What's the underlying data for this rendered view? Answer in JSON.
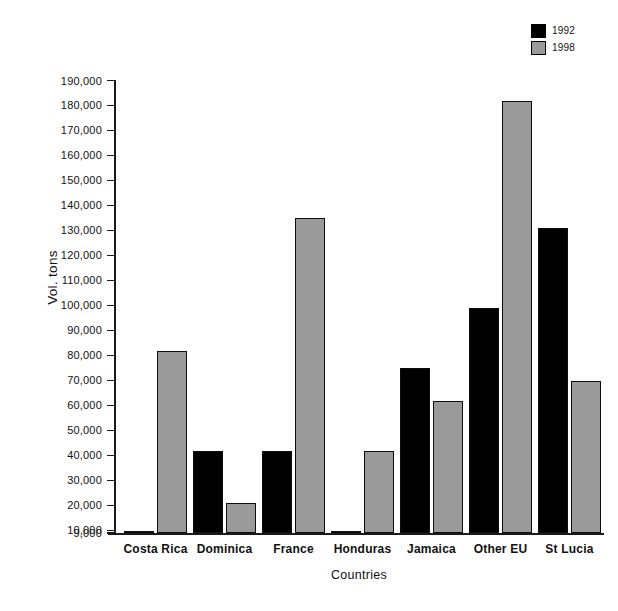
{
  "chart_data": {
    "type": "bar",
    "title": "",
    "xlabel": "Countries",
    "ylabel": "Vol. tons",
    "categories": [
      "Costa Rica",
      "Dominica",
      "France",
      "Honduras",
      "Jamaica",
      "Other EU",
      "St Lucia"
    ],
    "series": [
      {
        "name": "1992",
        "color": "#000000",
        "values": [
          9000,
          42000,
          42000,
          9000,
          75000,
          99000,
          131000
        ]
      },
      {
        "name": "1998",
        "color": "#9a9a9a",
        "values": [
          82000,
          21000,
          135000,
          42000,
          62000,
          182000,
          70000
        ]
      }
    ],
    "ylim": [
      9000,
      190000
    ],
    "y_ticks": [
      "190,000",
      "180,000",
      "170,000",
      "160,000",
      "150,000",
      "140,000",
      "130,000",
      "120,000",
      "110,000",
      "100,000",
      "90,000",
      "80,000",
      "70,000",
      "60,000",
      "50,000",
      "40,000",
      "30,000",
      "20,000",
      "10,000",
      "9,000"
    ],
    "y_tick_values": [
      190000,
      180000,
      170000,
      160000,
      150000,
      140000,
      130000,
      120000,
      110000,
      100000,
      90000,
      80000,
      70000,
      60000,
      50000,
      40000,
      30000,
      20000,
      10000,
      9000
    ],
    "grid": false,
    "legend_position": "top-right"
  }
}
